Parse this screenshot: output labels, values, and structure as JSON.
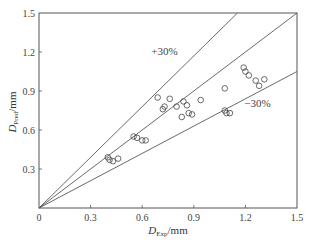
{
  "chart_data": {
    "type": "scatter",
    "title": "",
    "xlabel": "D_Exp/mm",
    "xlabel_main": "D",
    "xlabel_sub": "Exp",
    "xlabel_unit": "/mm",
    "ylabel": "D_Pred/mm",
    "ylabel_main": "D",
    "ylabel_sub": "Pred",
    "ylabel_unit": "/mm",
    "xlim": [
      0,
      1.5
    ],
    "ylim": [
      0,
      1.5
    ],
    "x_ticks": [
      "0",
      "0.3",
      "0.6",
      "0.9",
      "1.2",
      "1.5"
    ],
    "y_ticks": [
      "0",
      "0.3",
      "0.6",
      "0.9",
      "1.2",
      "1.5"
    ],
    "grid": false,
    "legend": null,
    "reference_lines": [
      {
        "name": "+30%",
        "slope": 1.3,
        "label": "+30%"
      },
      {
        "name": "parity",
        "slope": 1.0,
        "label": ""
      },
      {
        "name": "-30%",
        "slope": 0.7,
        "label": "−30%"
      }
    ],
    "annotations": [
      {
        "text": "+30%",
        "x": 0.73,
        "y": 1.18
      },
      {
        "text": "−30%",
        "x": 1.27,
        "y": 0.78
      }
    ],
    "marker": "open-circle",
    "points": [
      {
        "x": 0.4,
        "y": 0.39
      },
      {
        "x": 0.41,
        "y": 0.37
      },
      {
        "x": 0.43,
        "y": 0.36
      },
      {
        "x": 0.46,
        "y": 0.38
      },
      {
        "x": 0.55,
        "y": 0.55
      },
      {
        "x": 0.57,
        "y": 0.54
      },
      {
        "x": 0.6,
        "y": 0.52
      },
      {
        "x": 0.62,
        "y": 0.52
      },
      {
        "x": 0.69,
        "y": 0.85
      },
      {
        "x": 0.76,
        "y": 0.84
      },
      {
        "x": 0.73,
        "y": 0.78
      },
      {
        "x": 0.72,
        "y": 0.76
      },
      {
        "x": 0.8,
        "y": 0.78
      },
      {
        "x": 0.84,
        "y": 0.82
      },
      {
        "x": 0.86,
        "y": 0.79
      },
      {
        "x": 0.87,
        "y": 0.73
      },
      {
        "x": 0.89,
        "y": 0.72
      },
      {
        "x": 0.83,
        "y": 0.7
      },
      {
        "x": 0.94,
        "y": 0.83
      },
      {
        "x": 1.08,
        "y": 0.92
      },
      {
        "x": 1.08,
        "y": 0.75
      },
      {
        "x": 1.09,
        "y": 0.73
      },
      {
        "x": 1.11,
        "y": 0.73
      },
      {
        "x": 1.19,
        "y": 1.08
      },
      {
        "x": 1.2,
        "y": 1.05
      },
      {
        "x": 1.22,
        "y": 1.02
      },
      {
        "x": 1.26,
        "y": 0.98
      },
      {
        "x": 1.28,
        "y": 0.94
      },
      {
        "x": 1.31,
        "y": 0.99
      }
    ]
  },
  "colors": {
    "axis": "#555555",
    "line": "#444444",
    "marker": "#444444",
    "background": "#ffffff"
  }
}
